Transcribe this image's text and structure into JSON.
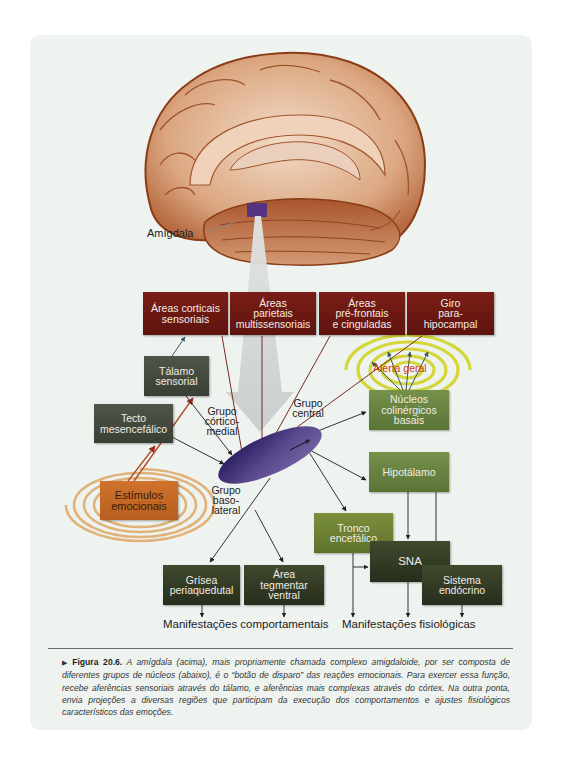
{
  "brain": {
    "label": "Amígdala",
    "colors": {
      "tissue": "#d9a27c",
      "outline": "#8a3c16",
      "amygdala_patch": "#4a2f8a"
    }
  },
  "cortex_boxes": [
    {
      "id": "corticais",
      "lines": [
        "Áreas corticais",
        "sensoriais"
      ]
    },
    {
      "id": "parietais",
      "lines": [
        "Áreas",
        "parietais",
        "multissensoriais"
      ]
    },
    {
      "id": "prefrontais",
      "lines": [
        "Áreas",
        "pré-frontais",
        "e cinguladas"
      ]
    },
    {
      "id": "giro",
      "lines": [
        "Giro",
        "para-",
        "hipocampal"
      ]
    }
  ],
  "nodes": {
    "talamo": [
      "Tálamo",
      "sensorial"
    ],
    "tecto": [
      "Tecto",
      "mesencefálico"
    ],
    "estimulos": [
      "Estímulos",
      "emocionais"
    ],
    "nucleos": [
      "Núcleos",
      "colinérgicos",
      "basais"
    ],
    "hipotalamo": [
      "Hipotálamo"
    ],
    "tronco": [
      "Tronco",
      "encefálico"
    ],
    "sna": [
      "SNA"
    ],
    "sistema": [
      "Sistema",
      "endócrino"
    ],
    "grisea": [
      "Grísea",
      "periaquedutal"
    ],
    "area_tegmentar": [
      "Área",
      "tegmentar",
      "ventral"
    ]
  },
  "groups": {
    "cortico_medial": [
      "Grupo",
      "córtico-",
      "medial"
    ],
    "central": [
      "Grupo",
      "central"
    ],
    "baso_lateral": [
      "Grupo",
      "baso-",
      "lateral"
    ]
  },
  "alerta_label": "Alerta geral",
  "outputs": {
    "behavioral": "Manifestações comportamentais",
    "physiological": "Manifestações fisiológicas"
  },
  "caption": {
    "marker": "▶",
    "figure_label": "Figura 20.6.",
    "text": "A amígdala (acima), mais propriamente chamada complexo amigdaloide, por ser composta de diferentes grupos de núcleos (abaixo), é o “botão de disparo” das reações emocionais. Para exercer essa função, recebe aferências sensoriais através do tálamo, e aferências mais complexas através do córtex. Na outra ponta, envia projeções a diversas regiões que participam da execução dos comportamentos e ajustes fisiológicos característicos das emoções."
  },
  "colors": {
    "cortex_box": "#6b1a12",
    "thalamic_box": "#454b3e",
    "output_green": "#688540",
    "output_dark": "#30381f",
    "stimulus_orange": "#c86a26",
    "alert_spiral": "#d4d63a",
    "stimulus_spiral": "#e0b27a",
    "amygdala": "#3e2a78",
    "alert_text": "#d23a10"
  }
}
